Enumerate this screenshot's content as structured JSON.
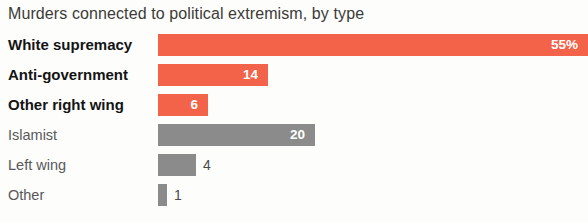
{
  "chart_data": {
    "type": "bar",
    "title": "Murders connected to political extremism, by type",
    "orientation": "horizontal",
    "xlabel": "",
    "ylabel": "",
    "grid": false,
    "legend": "none",
    "xlim": [
      0,
      55
    ],
    "categories": [
      "White supremacy",
      "Anti-government",
      "Other right wing",
      "Islamist",
      "Left wing",
      "Other"
    ],
    "values": [
      55,
      14,
      6,
      20,
      4,
      1
    ],
    "value_labels": [
      "55%",
      "14",
      "6",
      "20",
      "4",
      "1"
    ],
    "colors": [
      "#f2634a",
      "#f2634a",
      "#f2634a",
      "#8b8b8b",
      "#8b8b8b",
      "#8b8b8b"
    ],
    "series": [
      {
        "name": "Murders",
        "values": [
          55,
          14,
          6,
          20,
          4,
          1
        ]
      }
    ]
  },
  "bars": [
    {
      "label": "White supremacy",
      "value_label": "55%",
      "value": 55,
      "width_px": 430,
      "color_class": "red",
      "label_class": "strong",
      "label_inside": true
    },
    {
      "label": "Anti-government",
      "value_label": "14",
      "value": 14,
      "width_px": 110,
      "color_class": "red",
      "label_class": "strong",
      "label_inside": true
    },
    {
      "label": "Other right wing",
      "value_label": "6",
      "value": 6,
      "width_px": 50,
      "color_class": "red",
      "label_class": "strong",
      "label_inside": true
    },
    {
      "label": "Islamist",
      "value_label": "20",
      "value": 20,
      "width_px": 157,
      "color_class": "grey",
      "label_class": "plain",
      "label_inside": true
    },
    {
      "label": "Left wing",
      "value_label": "4",
      "value": 4,
      "width_px": 38,
      "color_class": "grey",
      "label_class": "plain",
      "label_inside": false
    },
    {
      "label": "Other",
      "value_label": "1",
      "value": 1,
      "width_px": 9,
      "color_class": "grey",
      "label_class": "plain",
      "label_inside": false
    }
  ]
}
